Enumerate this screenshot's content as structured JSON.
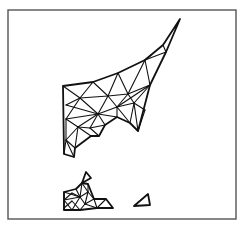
{
  "figure": {
    "type": "triangular-finite-element-mesh",
    "width": 243,
    "height": 226,
    "frame": {
      "x": 8,
      "y": 10,
      "width": 228,
      "height": 209,
      "color": "#555555"
    },
    "line_color": "#111111",
    "background": "#ffffff"
  },
  "regions": [
    {
      "name": "main-region",
      "boundary": [
        [
          63,
          86
        ],
        [
          93,
          82
        ],
        [
          118,
          73
        ],
        [
          145,
          60
        ],
        [
          163,
          45
        ],
        [
          180,
          19
        ],
        [
          166,
          52
        ],
        [
          150,
          85
        ],
        [
          138,
          131
        ],
        [
          130,
          123
        ],
        [
          117,
          117
        ],
        [
          105,
          125
        ],
        [
          99,
          136
        ],
        [
          91,
          136
        ],
        [
          75,
          148
        ],
        [
          74,
          157
        ],
        [
          64,
          154
        ]
      ],
      "edges": [
        [
          [
            163,
            45
          ],
          [
            166,
            52
          ]
        ],
        [
          [
            145,
            60
          ],
          [
            166,
            52
          ]
        ],
        [
          [
            145,
            60
          ],
          [
            151,
            55
          ]
        ],
        [
          [
            145,
            60
          ],
          [
            150,
            85
          ]
        ],
        [
          [
            118,
            73
          ],
          [
            128,
            94
          ]
        ],
        [
          [
            118,
            73
          ],
          [
            108,
            96
          ]
        ],
        [
          [
            128,
            94
          ],
          [
            150,
            85
          ]
        ],
        [
          [
            128,
            94
          ],
          [
            145,
            60
          ]
        ],
        [
          [
            93,
            82
          ],
          [
            80,
            98
          ]
        ],
        [
          [
            93,
            82
          ],
          [
            108,
            96
          ]
        ],
        [
          [
            80,
            98
          ],
          [
            108,
            96
          ]
        ],
        [
          [
            108,
            96
          ],
          [
            128,
            94
          ]
        ],
        [
          [
            63,
            86
          ],
          [
            80,
            98
          ]
        ],
        [
          [
            80,
            98
          ],
          [
            66,
            105
          ]
        ],
        [
          [
            80,
            98
          ],
          [
            98,
            114
          ]
        ],
        [
          [
            108,
            96
          ],
          [
            98,
            114
          ]
        ],
        [
          [
            108,
            96
          ],
          [
            117,
            107
          ]
        ],
        [
          [
            128,
            94
          ],
          [
            117,
            107
          ]
        ],
        [
          [
            128,
            94
          ],
          [
            134,
            103
          ]
        ],
        [
          [
            150,
            85
          ],
          [
            134,
            103
          ]
        ],
        [
          [
            150,
            85
          ],
          [
            117,
            107
          ]
        ],
        [
          [
            98,
            114
          ],
          [
            117,
            107
          ]
        ],
        [
          [
            117,
            107
          ],
          [
            134,
            103
          ]
        ],
        [
          [
            134,
            103
          ],
          [
            138,
            131
          ]
        ],
        [
          [
            134,
            103
          ],
          [
            145,
            110
          ]
        ],
        [
          [
            145,
            110
          ],
          [
            138,
            131
          ]
        ],
        [
          [
            117,
            107
          ],
          [
            130,
            123
          ]
        ],
        [
          [
            134,
            103
          ],
          [
            130,
            123
          ]
        ],
        [
          [
            117,
            107
          ],
          [
            117,
            117
          ]
        ],
        [
          [
            98,
            114
          ],
          [
            117,
            117
          ]
        ],
        [
          [
            98,
            114
          ],
          [
            105,
            125
          ]
        ],
        [
          [
            80,
            98
          ],
          [
            66,
            119
          ]
        ],
        [
          [
            66,
            105
          ],
          [
            98,
            114
          ]
        ],
        [
          [
            66,
            119
          ],
          [
            78,
            127
          ]
        ],
        [
          [
            98,
            114
          ],
          [
            78,
            127
          ]
        ],
        [
          [
            98,
            114
          ],
          [
            90,
            128
          ]
        ],
        [
          [
            90,
            128
          ],
          [
            105,
            125
          ]
        ],
        [
          [
            90,
            128
          ],
          [
            99,
            136
          ]
        ],
        [
          [
            78,
            127
          ],
          [
            90,
            128
          ]
        ],
        [
          [
            78,
            127
          ],
          [
            91,
            136
          ]
        ],
        [
          [
            66,
            119
          ],
          [
            66,
            140
          ]
        ],
        [
          [
            66,
            140
          ],
          [
            78,
            127
          ]
        ],
        [
          [
            78,
            127
          ],
          [
            75,
            148
          ]
        ],
        [
          [
            66,
            140
          ],
          [
            75,
            148
          ]
        ],
        [
          [
            66,
            140
          ],
          [
            74,
            157
          ]
        ],
        [
          [
            64,
            154
          ],
          [
            66,
            140
          ]
        ],
        [
          [
            66,
            119
          ],
          [
            98,
            114
          ]
        ]
      ]
    },
    {
      "name": "small-island-triangle",
      "boundary": [
        [
          82,
          183
        ],
        [
          86,
          172
        ],
        [
          91,
          178
        ]
      ],
      "edges": []
    },
    {
      "name": "lower-left-region",
      "boundary": [
        [
          64,
          192
        ],
        [
          76,
          189
        ],
        [
          82,
          183
        ],
        [
          88,
          184
        ],
        [
          94,
          199
        ],
        [
          106,
          199
        ],
        [
          113,
          208
        ],
        [
          97,
          208
        ],
        [
          80,
          210
        ],
        [
          64,
          210
        ]
      ],
      "edges": [
        [
          [
            64,
            192
          ],
          [
            80,
            197
          ]
        ],
        [
          [
            76,
            189
          ],
          [
            80,
            197
          ]
        ],
        [
          [
            82,
            183
          ],
          [
            80,
            197
          ]
        ],
        [
          [
            82,
            183
          ],
          [
            88,
            192
          ]
        ],
        [
          [
            88,
            184
          ],
          [
            88,
            192
          ]
        ],
        [
          [
            88,
            192
          ],
          [
            94,
            199
          ]
        ],
        [
          [
            80,
            197
          ],
          [
            88,
            192
          ]
        ],
        [
          [
            64,
            200
          ],
          [
            80,
            197
          ]
        ],
        [
          [
            64,
            200
          ],
          [
            72,
            210
          ]
        ],
        [
          [
            72,
            210
          ],
          [
            80,
            197
          ]
        ],
        [
          [
            80,
            197
          ],
          [
            85,
            204
          ]
        ],
        [
          [
            85,
            204
          ],
          [
            88,
            192
          ]
        ],
        [
          [
            85,
            204
          ],
          [
            94,
            199
          ]
        ],
        [
          [
            85,
            204
          ],
          [
            80,
            210
          ]
        ],
        [
          [
            85,
            204
          ],
          [
            97,
            208
          ]
        ],
        [
          [
            94,
            199
          ],
          [
            97,
            208
          ]
        ],
        [
          [
            97,
            208
          ],
          [
            106,
            199
          ]
        ],
        [
          [
            64,
            192
          ],
          [
            64,
            210
          ]
        ],
        [
          [
            64,
            200
          ],
          [
            72,
            193
          ]
        ],
        [
          [
            72,
            193
          ],
          [
            80,
            197
          ]
        ],
        [
          [
            64,
            208
          ],
          [
            72,
            201
          ]
        ],
        [
          [
            72,
            201
          ],
          [
            80,
            210
          ]
        ]
      ]
    },
    {
      "name": "isolated-triangle",
      "boundary": [
        [
          134,
          206
        ],
        [
          148,
          194
        ],
        [
          150,
          205
        ]
      ],
      "edges": []
    }
  ]
}
